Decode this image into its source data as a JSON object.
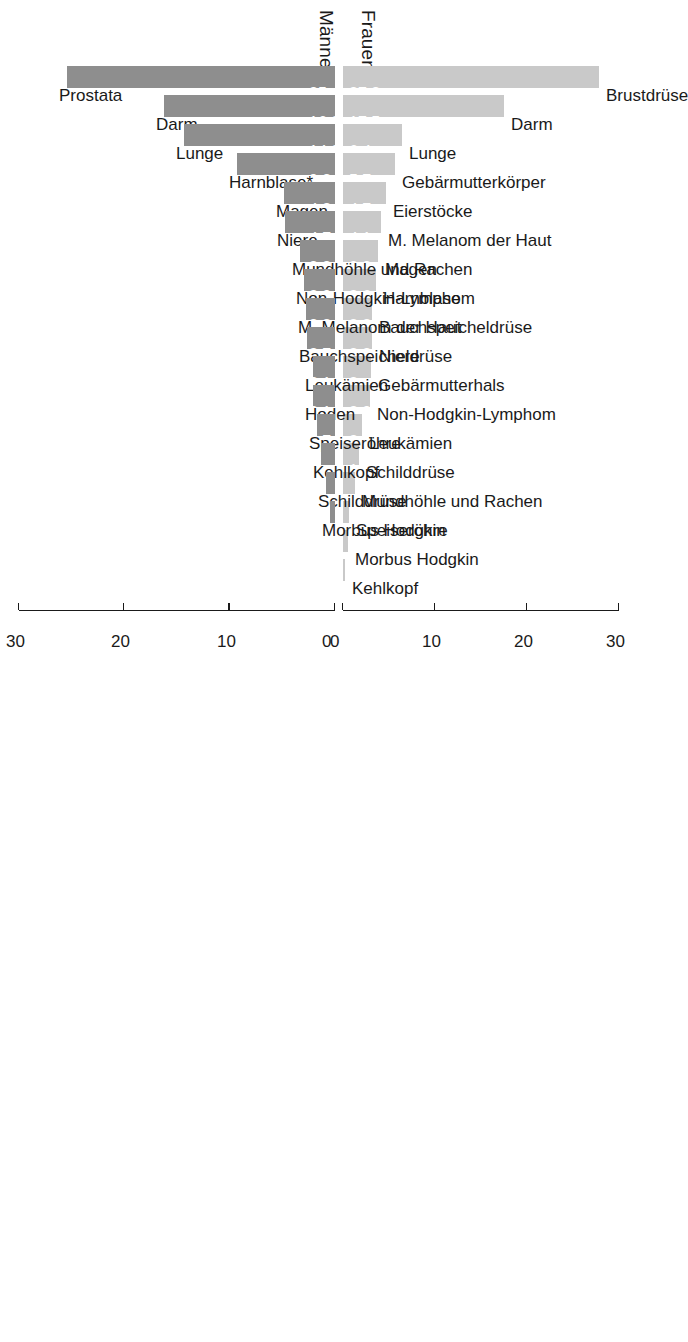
{
  "headers": {
    "men": "Männer",
    "women": "Frauen"
  },
  "axis": {
    "ticks": [
      "0",
      "10",
      "20",
      "30"
    ],
    "tick_values": [
      0,
      10,
      20,
      30
    ],
    "max": 30
  },
  "colors": {
    "men_bar": "#8e8e8e",
    "women_bar": "#c9c9c9",
    "text": "#1a1a1a",
    "value_text": "#ffffff",
    "background": "#ffffff"
  },
  "chart_data": {
    "type": "bar",
    "orientation": "back-to-back-horizontal",
    "title": "",
    "subtitle": "",
    "xlabel": "",
    "ylabel": "",
    "xlim": [
      0,
      30
    ],
    "grid": false,
    "legend_position": "none",
    "note": "Prozentualer Anteil an allen Krebsneuerkrankungen; * Harnblase einschließlich in-situ-Tumoren",
    "series": [
      {
        "name": "Männer",
        "color": "#8e8e8e",
        "categories": [
          "Prostata",
          "Darm",
          "Lunge",
          "Harnblase*",
          "Magen",
          "Niere",
          "Mundhöhle und Rachen",
          "Non-Hodgkin-Lymphom",
          "M. Melanom der Haut",
          "Bauchspeicheldrüse",
          "Leukämien",
          "Hoden",
          "Speiseröhre",
          "Kehlkopf",
          "Schilddrüse",
          "Morbus Hodgkin"
        ],
        "values": [
          25.4,
          16.2,
          14.3,
          9.3,
          4.8,
          4.7,
          3.3,
          2.9,
          2.8,
          2.7,
          2.1,
          2.1,
          1.7,
          1.3,
          0.9,
          0.5
        ],
        "labels": [
          "25,4",
          "16,2",
          "14,3",
          "9,3",
          "4,8",
          "4,7",
          "3,3",
          "2,9",
          "2,8",
          "2,7",
          "2,1",
          "2,1",
          "1,7",
          "",
          "",
          ""
        ]
      },
      {
        "name": "Frauen",
        "color": "#c9c9c9",
        "categories": [
          "Brustdrüse",
          "Darm",
          "Lunge",
          "Gebärmutterkörper",
          "Eierstöcke",
          "M. Melanom der Haut",
          "Magen",
          "Harnblase",
          "Bauchspeicheldrüse",
          "Niere",
          "Gebärmutterhals",
          "Non-Hodgkin-Lymphom",
          "Leukämien",
          "Schilddrüse",
          "Mundhöhle und Rachen",
          "Speiseröhre",
          "Morbus Hodgkin",
          "Kehlkopf"
        ],
        "values": [
          27.8,
          17.5,
          6.4,
          5.7,
          4.7,
          4.1,
          3.8,
          3.6,
          3.2,
          3.2,
          3.0,
          2.9,
          2.1,
          1.7,
          1.3,
          0.6,
          0.5,
          0.2
        ],
        "labels": [
          "27,8",
          "17,5",
          "6,4",
          "5,7",
          "4,7",
          "4,1",
          "3,8",
          "3,6",
          "3,2",
          "3,2",
          "3",
          "2,9",
          "2,1",
          "1,7",
          "",
          "",
          "",
          ""
        ]
      }
    ]
  }
}
